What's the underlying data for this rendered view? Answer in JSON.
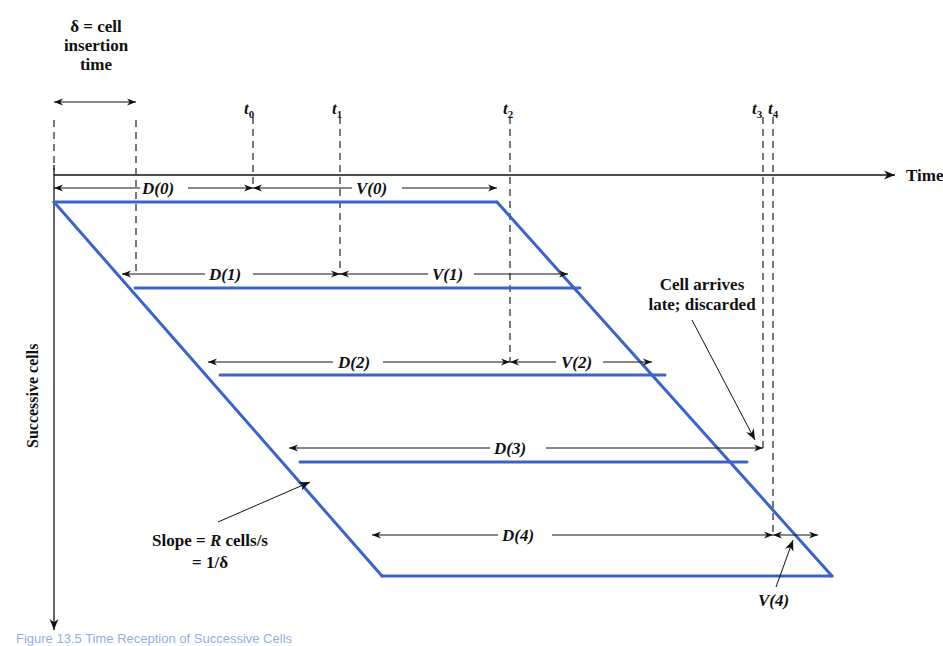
{
  "diagram": {
    "delta_label": {
      "line1": "δ = cell",
      "line2": "insertion",
      "line3": "time"
    },
    "time_axis_label": "Time",
    "vertical_axis_label": "Successive cells",
    "time_marks": [
      {
        "label": "t",
        "sub": "0",
        "x": 253
      },
      {
        "label": "t",
        "sub": "1",
        "x": 340
      },
      {
        "label": "t",
        "sub": "2",
        "x": 510
      },
      {
        "label": "t",
        "sub": "3",
        "x": 763
      },
      {
        "label": "t",
        "sub": "4",
        "x": 773
      }
    ],
    "cells": [
      {
        "D": "D(0)",
        "V": "V(0)"
      },
      {
        "D": "D(1)",
        "V": "V(1)"
      },
      {
        "D": "D(2)",
        "V": "V(2)"
      },
      {
        "D": "D(3)",
        "V": ""
      },
      {
        "D": "D(4)",
        "V": "V(4)"
      }
    ],
    "late_annotation": {
      "line1": "Cell arrives",
      "line2": "late; discarded"
    },
    "slope_annotation": {
      "line1_prefix": "Slope = ",
      "line1_var": "R",
      "line1_suffix": " cells/s",
      "line2": "= 1/δ"
    },
    "line_color": "#3b63c8",
    "caption": "Figure 13.5   Time Reception of Successive Cells"
  }
}
